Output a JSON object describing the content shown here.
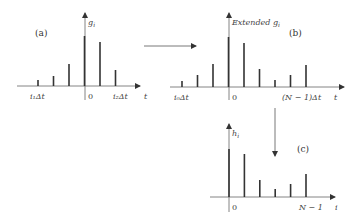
{
  "panels": {
    "a": {
      "label": "(a)",
      "y_label": "g",
      "y_sub": "i",
      "x_label": "t",
      "ticks": {
        "left": "i₁Δt",
        "zero": "0",
        "right": "i₂Δt"
      },
      "stems": [
        6,
        10,
        22,
        50,
        44,
        16
      ]
    },
    "b": {
      "label": "(b)",
      "y_label_prefix": "Extended ",
      "y_label": "g",
      "y_sub": "i",
      "x_label": "t",
      "ticks": {
        "left": "i₀Δt",
        "zero": "0",
        "right": "(N − 1)Δt"
      },
      "stems": [
        6,
        12,
        23,
        50,
        44,
        18,
        7,
        12,
        22
      ]
    },
    "c": {
      "label": "(c)",
      "y_label": "h",
      "y_sub": "i",
      "x_label": "i",
      "ticks": {
        "zero": "0",
        "right": "N − 1"
      },
      "stems": [
        48,
        43,
        17,
        8,
        13,
        23
      ]
    }
  },
  "colors": {
    "stem": "#333333",
    "axis": "#555555",
    "text": "#444444"
  }
}
